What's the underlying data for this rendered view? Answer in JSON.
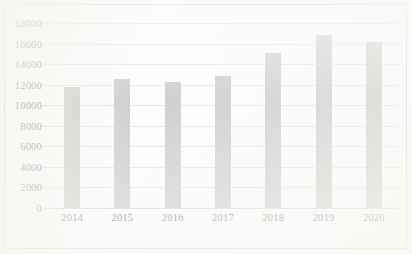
{
  "chart_data": {
    "type": "bar",
    "title": "",
    "subtitle": "",
    "xlabel": "",
    "ylabel": "",
    "categories": [
      "2014",
      "2015",
      "2016",
      "2017",
      "2018",
      "2019",
      "2020"
    ],
    "values": [
      11800,
      12600,
      12250,
      12850,
      15100,
      16800,
      16200
    ],
    "ylim": [
      0,
      18000
    ],
    "ytick_values": [
      0,
      2000,
      4000,
      6000,
      8000,
      10000,
      12000,
      14000,
      16000,
      18000
    ],
    "ytick_labels": [
      "0",
      "2000",
      "4000",
      "6000",
      "8000",
      "10000",
      "12000",
      "14000",
      "16000",
      "18000"
    ],
    "grid": "horizontal",
    "legend": "none",
    "annotations": [],
    "series": [
      {
        "name": "",
        "values": [
          11800,
          12600,
          12250,
          12850,
          15100,
          16800,
          16200
        ]
      }
    ]
  },
  "style": {
    "bar_color": "#b4b4b2",
    "gridline_color": "#d8d8d4",
    "axis_color": "#c3c3bd",
    "frame_color": "#b9b9b4",
    "background_color": "#fdfdfc",
    "text_color": "#2b2b2b"
  }
}
